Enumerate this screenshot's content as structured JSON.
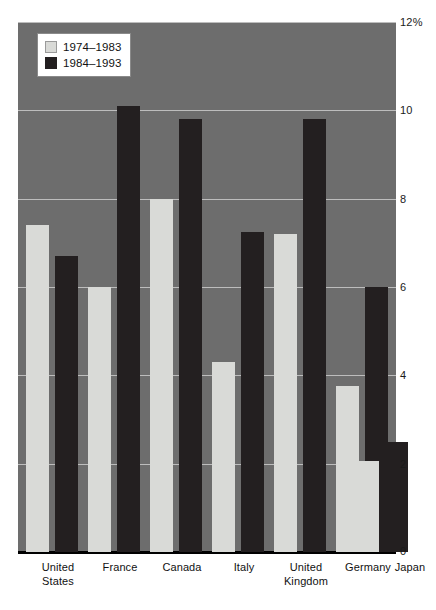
{
  "chart_data": {
    "type": "bar",
    "title": "",
    "subtitle": "",
    "xlabel": "",
    "ylabel": "",
    "ylim": [
      0,
      12
    ],
    "yticks": [
      "0",
      "2",
      "4",
      "6",
      "8",
      "10",
      "12%"
    ],
    "ytick_values": [
      0,
      2,
      4,
      6,
      8,
      10,
      12
    ],
    "grid": true,
    "legend_position": "top-left",
    "categories": [
      "United States",
      "France",
      "Canada",
      "Italy",
      "United Kingdom",
      "Germany",
      "Japan"
    ],
    "category_lines": [
      [
        "United",
        "States"
      ],
      [
        "France"
      ],
      [
        "Canada"
      ],
      [
        "Italy"
      ],
      [
        "United",
        "Kingdom"
      ],
      [
        "Germany"
      ],
      [
        "Japan"
      ]
    ],
    "series": [
      {
        "name": "1974–1983",
        "color": "#d9dad7",
        "values": [
          7.4,
          6.0,
          8.0,
          4.3,
          7.2,
          3.75,
          2.05
        ]
      },
      {
        "name": "1984–1993",
        "color": "#231f20",
        "values": [
          6.7,
          10.1,
          9.8,
          7.25,
          9.8,
          6.0,
          2.5
        ]
      }
    ]
  },
  "legend": {
    "items": [
      {
        "label": "1974–1983",
        "swatch": "light"
      },
      {
        "label": "1984–1993",
        "swatch": "dark"
      }
    ]
  },
  "colors": {
    "plot_background": "#6d6d6d",
    "gridline": "#bdbdbd",
    "axis": "#000000",
    "series_1974_1983": "#d9dad7",
    "series_1984_1993": "#231f20",
    "page_background": "#ffffff"
  }
}
